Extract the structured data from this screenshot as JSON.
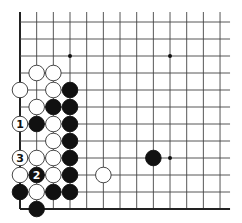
{
  "diagram": {
    "board": {
      "origin_x": 20,
      "origin_y": 22,
      "spacing_x": 16.67,
      "spacing_y": 17,
      "columns": 13,
      "rows": 12,
      "line_extend_top": 10,
      "line_extend_right": 10,
      "edges": [
        "left",
        "bottom"
      ],
      "line_color": "#444444",
      "edge_color": "#222222"
    },
    "star_points": [
      {
        "col": 3,
        "row": 2
      },
      {
        "col": 9,
        "row": 2
      },
      {
        "col": 9,
        "row": 8
      }
    ],
    "stones": [
      {
        "color": "white",
        "col": 1,
        "row": 3,
        "label": ""
      },
      {
        "color": "white",
        "col": 2,
        "row": 3,
        "label": ""
      },
      {
        "color": "white",
        "col": 0,
        "row": 4,
        "label": ""
      },
      {
        "color": "white",
        "col": 2,
        "row": 4,
        "label": ""
      },
      {
        "color": "black",
        "col": 3,
        "row": 4,
        "label": ""
      },
      {
        "color": "white",
        "col": 1,
        "row": 5,
        "label": ""
      },
      {
        "color": "black",
        "col": 2,
        "row": 5,
        "label": ""
      },
      {
        "color": "black",
        "col": 3,
        "row": 5,
        "label": ""
      },
      {
        "color": "white",
        "col": 0,
        "row": 6,
        "label": "1"
      },
      {
        "color": "black",
        "col": 1,
        "row": 6,
        "label": ""
      },
      {
        "color": "white",
        "col": 2,
        "row": 6,
        "label": ""
      },
      {
        "color": "black",
        "col": 3,
        "row": 6,
        "label": ""
      },
      {
        "color": "white",
        "col": 2,
        "row": 7,
        "label": ""
      },
      {
        "color": "black",
        "col": 3,
        "row": 7,
        "label": ""
      },
      {
        "color": "white",
        "col": 0,
        "row": 8,
        "label": "3"
      },
      {
        "color": "white",
        "col": 1,
        "row": 8,
        "label": ""
      },
      {
        "color": "white",
        "col": 2,
        "row": 8,
        "label": ""
      },
      {
        "color": "black",
        "col": 3,
        "row": 8,
        "label": ""
      },
      {
        "color": "black",
        "col": 8,
        "row": 8,
        "label": ""
      },
      {
        "color": "white",
        "col": 0,
        "row": 9,
        "label": ""
      },
      {
        "color": "black",
        "col": 1,
        "row": 9,
        "label": "2"
      },
      {
        "color": "white",
        "col": 2,
        "row": 9,
        "label": ""
      },
      {
        "color": "black",
        "col": 3,
        "row": 9,
        "label": ""
      },
      {
        "color": "white",
        "col": 5,
        "row": 9,
        "label": ""
      },
      {
        "color": "black",
        "col": 0,
        "row": 10,
        "label": ""
      },
      {
        "color": "white",
        "col": 1,
        "row": 10,
        "label": ""
      },
      {
        "color": "black",
        "col": 2,
        "row": 10,
        "label": ""
      },
      {
        "color": "black",
        "col": 3,
        "row": 10,
        "label": ""
      },
      {
        "color": "black",
        "col": 1,
        "row": 11,
        "label": ""
      }
    ],
    "colors": {
      "black_stone": "#111111",
      "white_stone": "#ffffff",
      "stone_outline": "#333333"
    }
  }
}
